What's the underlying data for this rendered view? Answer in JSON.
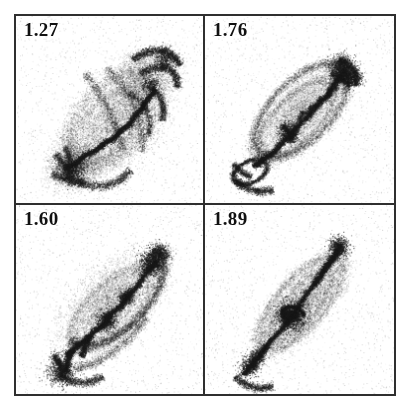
{
  "figure": {
    "type": "multi-panel-image-grid",
    "rows": 2,
    "columns": 2,
    "background_color": "#ffffff",
    "frame_color": "#2f2f2f",
    "ink_color": "#1a1a1a"
  },
  "panels": [
    {
      "id": "panel-top-left",
      "label": "1.27",
      "position": "top-left",
      "content": "grayscale point-density map of an edge-on interacting galaxy pair with bright narrow tidal filament running from lower-left to upper-right and diffuse fan-shaped plumes"
    },
    {
      "id": "panel-top-right",
      "label": "1.76",
      "position": "top-right",
      "content": "grayscale point-density map showing an elongated loop/shell envelope with a dense knotted ridge along the major axis oriented lower-left to upper-right"
    },
    {
      "id": "panel-bottom-left",
      "label": "1.60",
      "position": "bottom-left",
      "content": "grayscale point-density map with a prominent arcing outer loop and a thick clumpy filament crossing the centre diagonally"
    },
    {
      "id": "panel-bottom-right",
      "label": "1.89",
      "position": "bottom-right",
      "content": "grayscale point-density map of a narrow elongated spindle with a compact dark core knot near the centre and faint extended halo"
    }
  ],
  "chart_data": {
    "type": "scatter",
    "title": "",
    "xlabel": "",
    "ylabel": "",
    "panel_labels": [
      "1.27",
      "1.76",
      "1.60",
      "1.89"
    ],
    "series": [
      {
        "name": "1.27",
        "values": [
          1.27
        ]
      },
      {
        "name": "1.76",
        "values": [
          1.76
        ]
      },
      {
        "name": "1.60",
        "values": [
          1.6
        ]
      },
      {
        "name": "1.89",
        "values": [
          1.89
        ]
      }
    ],
    "grid": false,
    "legend_position": "none"
  }
}
